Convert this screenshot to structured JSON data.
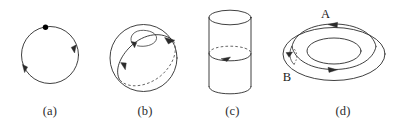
{
  "figure": {
    "background_color": "#ffffff",
    "line_color": "#2b2b2b",
    "panels": [
      {
        "id": "a",
        "caption": "(a)",
        "shape": "circle-with-basepoint",
        "description": "Circle with a marked base point at top and two arrowheads indicating clockwise orientation",
        "arrow_count": 2,
        "basepoint_visible": true
      },
      {
        "id": "b",
        "caption": "(b)",
        "shape": "sphere-with-contractible-loop",
        "description": "Sphere with a great-circle loop, dashed on the hidden rear half, and a small loop being contracted near the top with arrows",
        "arrow_count": 3,
        "hidden_arc_dashed": true
      },
      {
        "id": "c",
        "caption": "(c)",
        "shape": "cylinder-with-encircling-loop",
        "description": "Vertical cylinder with an ellipse drawn around its middle; the far half is dashed and an arrow marks the orientation",
        "arrow_count": 1,
        "hidden_arc_dashed": true
      },
      {
        "id": "d",
        "caption": "(d)",
        "shape": "torus-with-two-loops",
        "description": "Torus drawn in perspective with a longitudinal loop labelled A and a small meridian loop labelled B",
        "arrow_count": 3,
        "hidden_arc_dashed": true,
        "labels": [
          {
            "text": "A",
            "name": "loop-a-label"
          },
          {
            "text": "B",
            "name": "loop-b-label"
          }
        ]
      }
    ]
  }
}
